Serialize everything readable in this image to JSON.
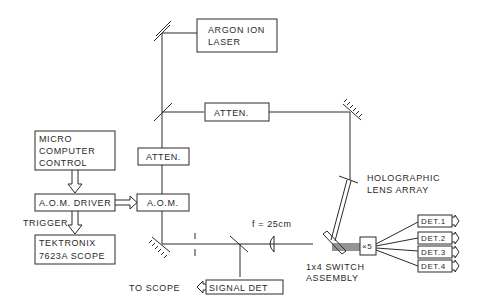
{
  "diagram": {
    "type": "optical-setup-schematic",
    "components": {
      "laser": {
        "line1": "ARGON ION",
        "line2": "LASER"
      },
      "atten_top": {
        "label": "ATTEN."
      },
      "atten_left": {
        "label": "ATTEN."
      },
      "aom": {
        "label": "A.O.M."
      },
      "aom_driver": {
        "label": "A.O.M. DRIVER"
      },
      "micro": {
        "line1": "MICRO",
        "line2": "COMPUTER",
        "line3": "CONTROL"
      },
      "scope": {
        "line1": "TEKTRONIX",
        "line2": "7623A SCOPE"
      },
      "trigger": {
        "label": "TRIGGER"
      },
      "signal_det": {
        "label": "SIGNAL DET"
      },
      "to_scope": {
        "label": "TO SCOPE"
      },
      "lens": {
        "label": "f = 25cm"
      },
      "holo": {
        "line1": "HOLOGRAPHIC",
        "line2": "LENS ARRAY"
      },
      "switch": {
        "line1": "1x4 SWITCH",
        "line2": "ASSEMBLY"
      },
      "amp": {
        "label": "×5"
      },
      "detectors": [
        {
          "label": "DET.1"
        },
        {
          "label": "DET.2"
        },
        {
          "label": "DET.3"
        },
        {
          "label": "DET.4"
        }
      ]
    }
  }
}
